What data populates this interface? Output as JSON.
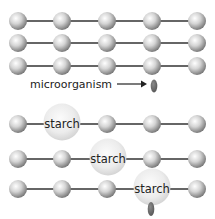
{
  "diagram": {
    "colors": {
      "background": "#ffffff",
      "chain_line": "#333333",
      "sphere_light": "#ffffff",
      "sphere_mid": "#c8c8c8",
      "sphere_dark": "#7a7a7a",
      "starch_light": "#f7f7f7",
      "starch_dark": "#d2d2d2",
      "microorganism": "#6b6b6b",
      "text": "#222222"
    },
    "columns_x": [
      18,
      62,
      107,
      152,
      197
    ],
    "top_panel": {
      "chains": [
        {
          "y": 21,
          "units": [
            "sphere",
            "sphere",
            "sphere",
            "sphere",
            "sphere"
          ]
        },
        {
          "y": 43,
          "units": [
            "sphere",
            "sphere",
            "sphere",
            "sphere",
            "sphere"
          ]
        },
        {
          "y": 66,
          "units": [
            "sphere",
            "sphere",
            "sphere",
            "sphere",
            "sphere"
          ]
        }
      ],
      "microorganism_label": "microorganism",
      "arrow": {
        "from_x": 117,
        "to_x": 146,
        "y": 84
      },
      "microorganism": {
        "x": 154,
        "y": 86
      }
    },
    "bottom_panel": {
      "chains": [
        {
          "y": 124,
          "starch_index": 1,
          "starch_label": "starch"
        },
        {
          "y": 159,
          "starch_index": 2,
          "starch_label": "starch"
        },
        {
          "y": 188,
          "starch_index": 3,
          "starch_label": "starch"
        }
      ],
      "microorganism": {
        "x": 151,
        "y": 209
      }
    }
  }
}
